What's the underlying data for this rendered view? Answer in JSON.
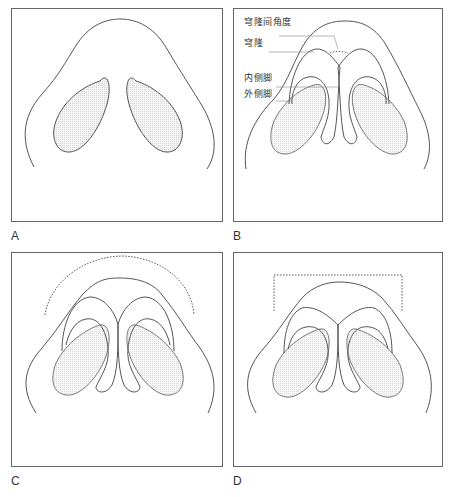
{
  "figure": {
    "panels": [
      {
        "letter": "A",
        "description": "Nasal base view with nostrils only"
      },
      {
        "letter": "B",
        "description": "Nasal base view with tip cartilages labeled"
      },
      {
        "letter": "C",
        "description": "Nasal tip with dotted rounded (arched) outline"
      },
      {
        "letter": "D",
        "description": "Nasal tip with dotted boxy (square) outline"
      }
    ],
    "labels": {
      "interdomal_angle": "穹隆间角度",
      "dome": "穹隆",
      "medial_crus": "内侧脚",
      "lateral_crus": "外侧脚"
    },
    "colors": {
      "line": "#555555",
      "light_line": "#9a9a9a",
      "nostril_fill": "#ececec",
      "border": "#666666"
    }
  }
}
